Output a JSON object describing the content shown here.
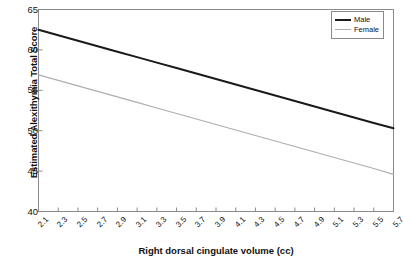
{
  "chart_data": {
    "type": "line",
    "title": "",
    "xlabel": "Right dorsal cingulate volume (cc)",
    "ylabel": "Estimated Alexithymia Total Score",
    "xlim": [
      2.1,
      5.7
    ],
    "ylim": [
      40,
      65
    ],
    "ytick_labels": [
      "65",
      "60",
      "55",
      "50",
      "45",
      "40"
    ],
    "ytick_values": [
      65,
      60,
      55,
      50,
      45,
      40
    ],
    "xtick_labels": [
      "2.1",
      "2.3",
      "2.5",
      "2.7",
      "2.9",
      "3.1",
      "3.3",
      "3.5",
      "3.7",
      "3.9",
      "4.1",
      "4.3",
      "4.5",
      "4.7",
      "4.9",
      "5.1",
      "5.3",
      "5.5",
      "5.7"
    ],
    "x": [
      2.1,
      2.3,
      2.5,
      2.7,
      2.9,
      3.1,
      3.3,
      3.5,
      3.7,
      3.9,
      4.1,
      4.3,
      4.5,
      4.7,
      4.9,
      5.1,
      5.3,
      5.5,
      5.7
    ],
    "grid": false,
    "legend_position": "top-right",
    "series": [
      {
        "name": "Male",
        "color": "#1a1a1a",
        "line_width": 2,
        "values": [
          62.5,
          61.82,
          61.14,
          60.46,
          59.78,
          59.11,
          58.43,
          57.75,
          57.07,
          56.39,
          55.71,
          55.03,
          54.36,
          53.68,
          53.0,
          52.32,
          51.64,
          50.96,
          50.3
        ]
      },
      {
        "name": "Female",
        "color": "#aeaeae",
        "line_width": 1.2,
        "values": [
          56.9,
          56.22,
          55.54,
          54.86,
          54.18,
          53.5,
          52.81,
          52.13,
          51.45,
          50.77,
          50.09,
          49.41,
          48.73,
          48.05,
          47.36,
          46.68,
          46.0,
          45.32,
          44.6
        ]
      }
    ]
  },
  "legend": {
    "items": [
      {
        "label": "Male"
      },
      {
        "label": "Female"
      }
    ]
  },
  "axes": {
    "y_title": "Estimated Alexithymia Total Score",
    "x_title": "Right dorsal cingulate volume (cc)"
  }
}
